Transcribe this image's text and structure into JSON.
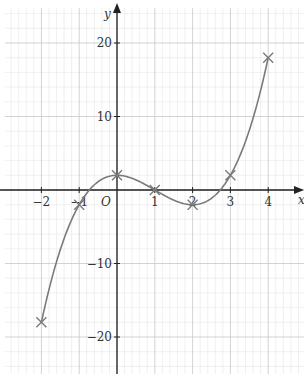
{
  "chart_data": {
    "type": "line",
    "title": "",
    "xlabel": "x",
    "ylabel": "y",
    "origin_label": "O",
    "function": "y = x^3 - 3x^2 + 2",
    "xlim": [
      -3,
      4.5
    ],
    "ylim": [
      -24,
      24
    ],
    "grid": true,
    "x_ticks": [
      -2,
      -1,
      1,
      2,
      3,
      4
    ],
    "x_tick_labels": [
      "−2",
      "−1",
      "1",
      "2",
      "3",
      "4"
    ],
    "y_ticks": [
      20,
      10,
      -10,
      -20
    ],
    "y_tick_labels": [
      "20",
      "10",
      "−10",
      "−20"
    ],
    "points": [
      {
        "x": -2,
        "y": -18
      },
      {
        "x": -1,
        "y": -2
      },
      {
        "x": 0,
        "y": 2
      },
      {
        "x": 1,
        "y": 0
      },
      {
        "x": 2,
        "y": -2
      },
      {
        "x": 3,
        "y": 2
      },
      {
        "x": 4,
        "y": 18
      }
    ],
    "marker": "x",
    "colors": {
      "curve": "#7a7a7a",
      "axis": "#222222",
      "grid_major": "#c8c8c8",
      "grid_minor": "#e6e6e6"
    }
  }
}
